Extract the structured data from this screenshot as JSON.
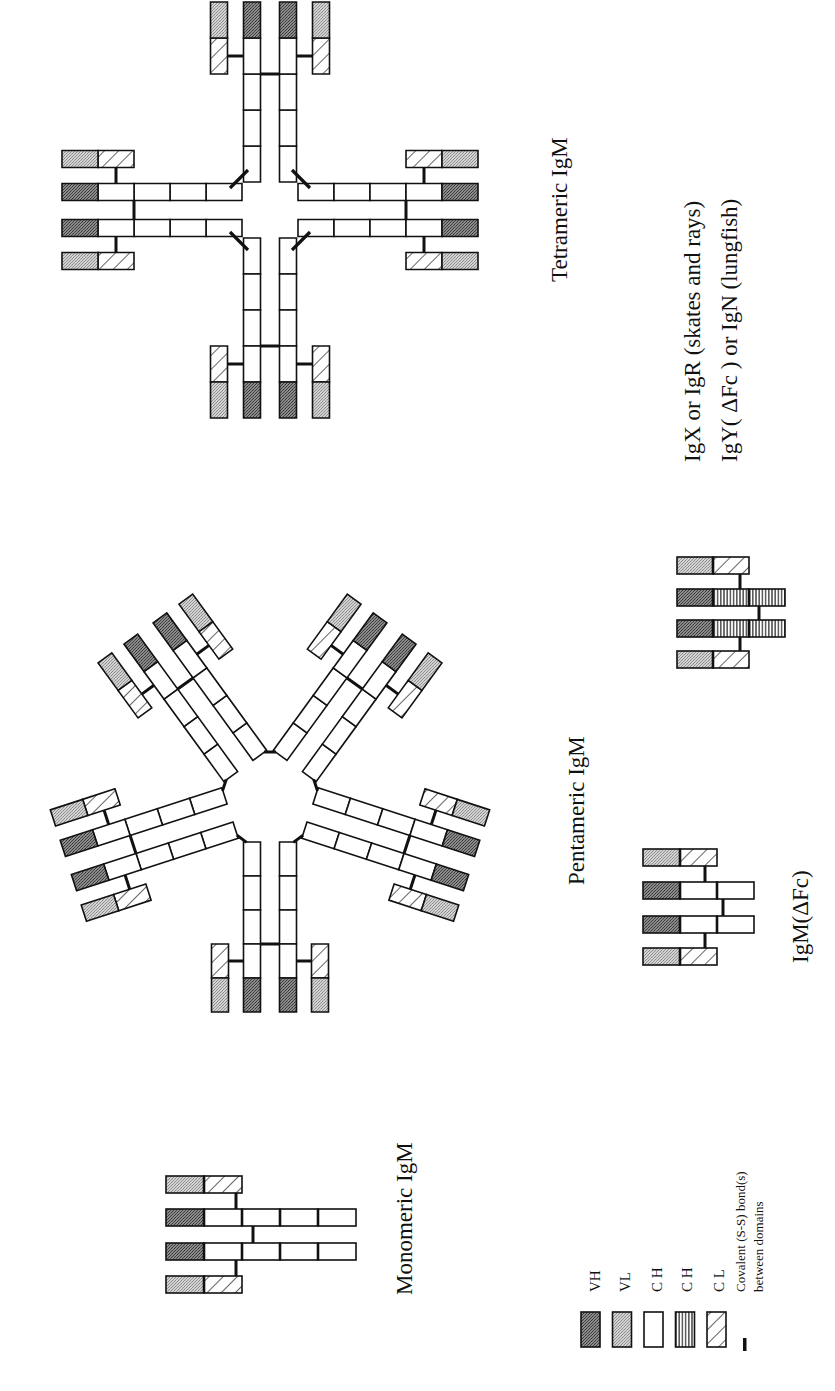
{
  "figure": {
    "orientation": "rotated 90 degrees counter-clockwise",
    "labels": {
      "monomeric": "Monomeric IgM",
      "pentameric": "Pentameric IgM",
      "tetrameric": "Tetrameric IgM",
      "igm_dfc": "IgM(ΔFc)",
      "igx_line1": "IgX or IgR (skates and rays)",
      "igx_line2": "IgY( ΔFc ) or IgN (lungfish)"
    }
  },
  "legend": {
    "items": [
      {
        "key": "VH",
        "label": "VH",
        "pattern": "dark-stipple"
      },
      {
        "key": "VL",
        "label": "VL",
        "pattern": "light-stipple"
      },
      {
        "key": "CH",
        "label": "C H",
        "pattern": "white"
      },
      {
        "key": "CH_striped",
        "label": "C H",
        "pattern": "vertical-stripes"
      },
      {
        "key": "CL",
        "label": "C L",
        "pattern": "diagonal-hatch"
      },
      {
        "key": "SS",
        "label_line1": "Covalent (S-S) bond(s)",
        "label_line2": "between domains",
        "pattern": "bar"
      }
    ]
  },
  "structures": {
    "monomer": {
      "heavy_chain_domains": [
        "VH",
        "CH",
        "CH",
        "CH",
        "CH"
      ],
      "light_chain_domains": [
        "VL",
        "CL"
      ],
      "chains": 4
    },
    "pentamer": {
      "subunits": 5,
      "center": [
        270,
        800
      ]
    },
    "tetramer": {
      "subunits": 4,
      "center": [
        270,
        210
      ]
    },
    "igm_dfc": {
      "heavy_chain_domains": [
        "VH",
        "CH",
        "CH"
      ],
      "light_chain_domains": [
        "VL",
        "CL"
      ]
    },
    "igx": {
      "heavy_chain_domains": [
        "VH",
        "CH_striped",
        "CH_striped"
      ],
      "light_chain_domains": [
        "VL",
        "CL"
      ]
    }
  },
  "colors": {
    "outline": "#111111",
    "vh_fill": "#6e6e6e",
    "vl_fill": "#bdbdbd",
    "ch_fill": "#ffffff"
  }
}
